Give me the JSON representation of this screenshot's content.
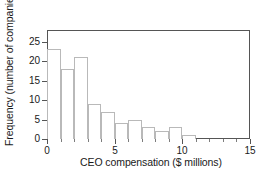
{
  "chart_data": {
    "type": "bar",
    "title": "",
    "subtitle": "",
    "xlabel": "CEO compensation ($ millions)",
    "ylabel": "Frequency (number of companies)",
    "xlim": [
      0,
      15
    ],
    "ylim": [
      0,
      28
    ],
    "bin_width": 1,
    "grid": false,
    "legend": null,
    "xticks": [
      0,
      5,
      10,
      15
    ],
    "xtick_labels": [
      "0",
      "5",
      "10",
      "15"
    ],
    "xticks_minor": [
      1,
      2,
      3,
      4,
      6,
      7,
      8,
      9,
      11,
      12,
      13,
      14
    ],
    "yticks": [
      0,
      5,
      10,
      15,
      20,
      25
    ],
    "ytick_labels": [
      "0",
      "5",
      "10",
      "15",
      "20",
      "25"
    ],
    "categories": [
      "0-1",
      "1-2",
      "2-3",
      "3-4",
      "4-5",
      "5-6",
      "6-7",
      "7-8",
      "8-9",
      "9-10",
      "10-11"
    ],
    "bin_edges": [
      0,
      1,
      2,
      3,
      4,
      5,
      6,
      7,
      8,
      9,
      10,
      11
    ],
    "values": [
      23,
      18,
      21,
      9,
      7,
      4,
      5,
      3,
      2,
      3,
      1
    ],
    "bar_fill_color": "#ffffff",
    "bar_edge_color": "#b9b9b9",
    "axis_color": "#555555",
    "text_color": "#1a1a1a",
    "background_color": "#ffffff"
  }
}
